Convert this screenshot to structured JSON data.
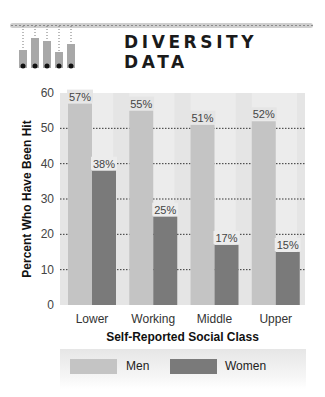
{
  "header": {
    "title": "DIVERSITY DATA",
    "logo_icon": "thermometer-bars-icon"
  },
  "colors": {
    "men": "#c4c4c4",
    "women": "#7a7a7a",
    "plot_bg": "#e5e5e5",
    "col_bg": "#ececec"
  },
  "chart_data": {
    "type": "bar",
    "title": "DIVERSITY DATA",
    "xlabel": "Self-Reported Social Class",
    "ylabel": "Percent Who Have Been Hit",
    "categories": [
      "Lower",
      "Working",
      "Middle",
      "Upper"
    ],
    "series": [
      {
        "name": "Men",
        "values": [
          57,
          55,
          51,
          52
        ],
        "labels": [
          "57%",
          "55%",
          "51%",
          "52%"
        ]
      },
      {
        "name": "Women",
        "values": [
          38,
          25,
          17,
          15
        ],
        "labels": [
          "38%",
          "25%",
          "17%",
          "15%"
        ]
      }
    ],
    "ylim": [
      0,
      60
    ],
    "yticks": [
      0,
      10,
      20,
      30,
      40,
      50,
      60
    ],
    "grid": true,
    "legend": "bottom"
  },
  "legend": {
    "men": "Men",
    "women": "Women"
  }
}
